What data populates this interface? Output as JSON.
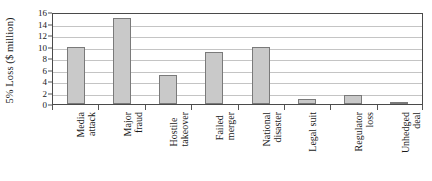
{
  "chart_data": {
    "type": "bar",
    "title": "",
    "xlabel": "",
    "ylabel": "5% Loss ($ million)",
    "categories": [
      "Media attack",
      "Major fraud",
      "Hostile takeover",
      "Failed merger",
      "National disaster",
      "Legal suit",
      "Regulator loss",
      "Unhedged deal"
    ],
    "category_lines": [
      [
        "Media",
        "attack"
      ],
      [
        "Major",
        "fraud"
      ],
      [
        "Hostile",
        "takeover"
      ],
      [
        "Failed",
        "merger"
      ],
      [
        "National",
        "disaster"
      ],
      [
        "Legal suit",
        ""
      ],
      [
        "Regulator",
        "loss"
      ],
      [
        "Unhedged",
        "deal"
      ]
    ],
    "values": [
      10,
      15,
      5,
      9,
      10,
      0.9,
      1.5,
      0.3
    ],
    "ylim": [
      0,
      16
    ],
    "yticks": [
      0,
      2,
      4,
      6,
      8,
      10,
      12,
      14,
      16
    ],
    "ytick_labels": [
      "0",
      "2",
      "4",
      "6",
      "8",
      "10",
      "12",
      "14",
      "16"
    ],
    "grid": true,
    "legend": false,
    "bar_fill": "#c9c9c9",
    "bar_edge": "#7a7a7a",
    "axis_color": "#4a4a4a",
    "grid_color": "#c4c4c4"
  }
}
